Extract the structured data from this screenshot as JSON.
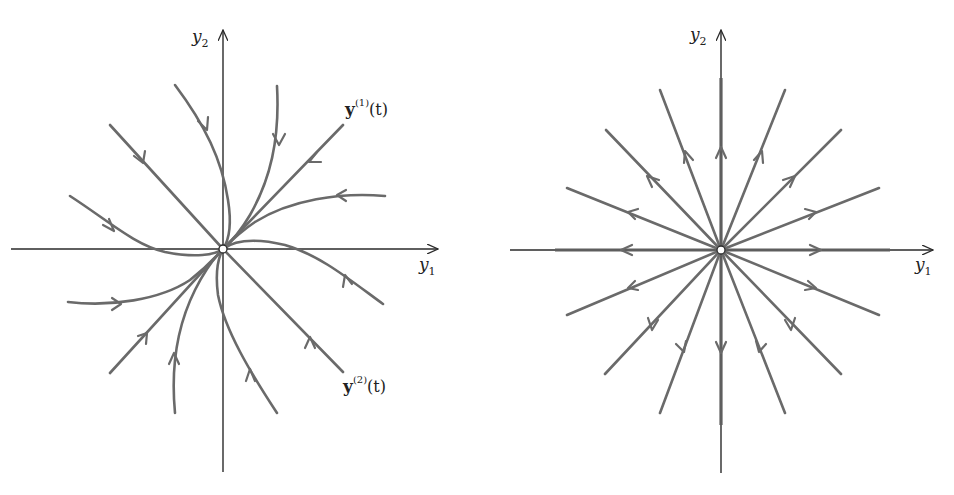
{
  "figure": {
    "panels": [
      {
        "id": "left",
        "description": "Improper (degenerate) node, asymptotically stable: trajectories approach origin tangent to eigenvector direction",
        "axis_labels": {
          "horizontal": "y",
          "horizontal_sub": "1",
          "vertical": "y",
          "vertical_sub": "2"
        },
        "annotations": [
          {
            "text_bold": "y",
            "sup": "(1)",
            "tail": "(t)"
          },
          {
            "text_bold": "y",
            "sup": "(2)",
            "tail": "(t)"
          }
        ],
        "flow": "inward"
      },
      {
        "id": "right",
        "description": "Proper node (star point), unstable: straight-line trajectories radiate outward from origin",
        "axis_labels": {
          "horizontal": "y",
          "horizontal_sub": "1",
          "vertical": "y",
          "vertical_sub": "2"
        },
        "flow": "outward",
        "ray_count": 16
      }
    ],
    "colors": {
      "axis": "#2a2a2a",
      "trajectory": "#6a6a6a",
      "background": "#ffffff"
    }
  }
}
